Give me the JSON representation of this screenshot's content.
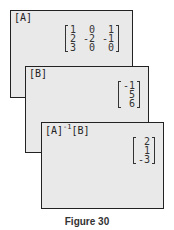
{
  "screens": [
    {
      "title": "[A]",
      "matrix": [
        [
          "1",
          "0",
          "1"
        ],
        [
          "2",
          "-2",
          "-1"
        ],
        [
          "3",
          "0",
          "0"
        ]
      ]
    },
    {
      "title": "[B]",
      "matrix": [
        [
          "-1"
        ],
        [
          "5"
        ],
        [
          "6"
        ]
      ]
    },
    {
      "title_main": "[A]",
      "title_sup": "-1",
      "title_rest": "[B]",
      "matrix": [
        [
          "2"
        ],
        [
          "1"
        ],
        [
          "-3"
        ]
      ]
    }
  ],
  "caption": "Figure 30"
}
